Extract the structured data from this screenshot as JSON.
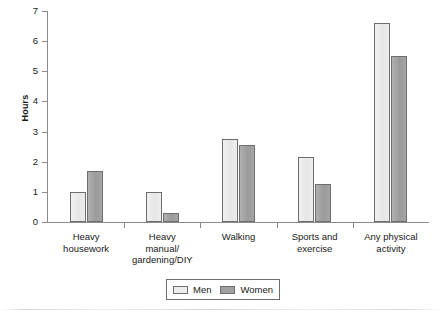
{
  "chart_data": {
    "type": "bar",
    "title": "",
    "xlabel": "",
    "ylabel": "Hours",
    "ylim": [
      0,
      7
    ],
    "ytick_step": 1,
    "yticks": [
      "7",
      "6",
      "5",
      "4",
      "3",
      "2",
      "1",
      "0"
    ],
    "grid": false,
    "legend_position": "bottom-center",
    "categories": [
      "Heavy\nhousework",
      "Heavy\nmanual/\ngardening/DIY",
      "Walking",
      "Sports and\nexercise",
      "Any physical\nactivity"
    ],
    "series": [
      {
        "name": "Men",
        "values": [
          1.0,
          1.0,
          2.75,
          2.15,
          6.6
        ]
      },
      {
        "name": "Women",
        "values": [
          1.7,
          0.3,
          2.55,
          1.25,
          5.5
        ]
      }
    ],
    "colors": {
      "men": "#ededed",
      "women": "#a0a0a0",
      "bar_outline": "#6e6e6e",
      "axis": "#8a8a8a",
      "text": "#1a1a1a"
    }
  },
  "legend": {
    "entries": [
      {
        "label": "Men"
      },
      {
        "label": "Women"
      }
    ]
  }
}
